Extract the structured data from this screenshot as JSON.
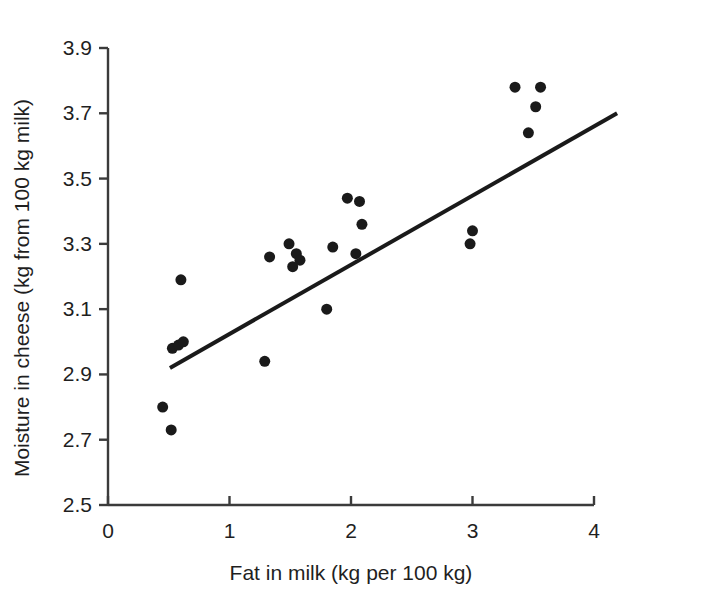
{
  "chart_data": {
    "type": "scatter",
    "title": "",
    "xlabel": "Fat in milk (kg per 100 kg)",
    "ylabel": "Moisture in cheese (kg from 100 kg milk)",
    "xlim": [
      0,
      4
    ],
    "ylim": [
      2.5,
      3.9
    ],
    "xticks": [
      0,
      1,
      2,
      3,
      4
    ],
    "xtick_labels": [
      "0",
      "1",
      "2",
      "3",
      "4"
    ],
    "yticks": [
      2.5,
      2.7,
      2.9,
      3.1,
      3.3,
      3.5,
      3.7,
      3.9
    ],
    "ytick_labels": [
      "2.5",
      "2.7",
      "2.9",
      "3.1",
      "3.3",
      "3.5",
      "3.7",
      "3.9"
    ],
    "grid": false,
    "legend": null,
    "marker": {
      "shape": "circle",
      "color": "#1a1a1a",
      "size_px": 11
    },
    "points": [
      {
        "x": 0.45,
        "y": 2.8
      },
      {
        "x": 0.52,
        "y": 2.73
      },
      {
        "x": 0.53,
        "y": 2.98
      },
      {
        "x": 0.58,
        "y": 2.99
      },
      {
        "x": 0.62,
        "y": 3.0
      },
      {
        "x": 0.6,
        "y": 3.19
      },
      {
        "x": 1.29,
        "y": 2.94
      },
      {
        "x": 1.33,
        "y": 3.26
      },
      {
        "x": 1.49,
        "y": 3.3
      },
      {
        "x": 1.55,
        "y": 3.27
      },
      {
        "x": 1.58,
        "y": 3.25
      },
      {
        "x": 1.52,
        "y": 3.23
      },
      {
        "x": 1.8,
        "y": 3.1
      },
      {
        "x": 1.85,
        "y": 3.29
      },
      {
        "x": 1.97,
        "y": 3.44
      },
      {
        "x": 2.07,
        "y": 3.43
      },
      {
        "x": 2.09,
        "y": 3.36
      },
      {
        "x": 2.04,
        "y": 3.27
      },
      {
        "x": 2.98,
        "y": 3.3
      },
      {
        "x": 3.0,
        "y": 3.34
      },
      {
        "x": 3.35,
        "y": 3.78
      },
      {
        "x": 3.46,
        "y": 3.64
      },
      {
        "x": 3.52,
        "y": 3.72
      },
      {
        "x": 3.56,
        "y": 3.78
      }
    ],
    "fit_line": {
      "type": "linear-regression",
      "x_start": 0.51,
      "y_start": 2.92,
      "x_end": 4.19,
      "y_end": 3.7,
      "color": "#1a1a1a",
      "width_px": 4
    }
  },
  "axes": {
    "x_axis_name": "fat-in-milk-axis",
    "y_axis_name": "moisture-in-cheese-axis"
  }
}
